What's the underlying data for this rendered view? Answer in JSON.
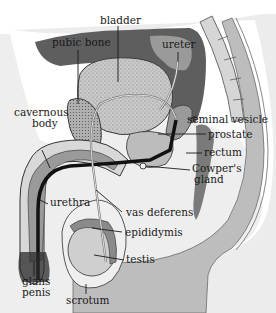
{
  "diagram": {
    "colors": {
      "background": "#ffffff",
      "body_fill": "#e4e4e4",
      "body_dark": "#5a5a5a",
      "bone_mid": "#8a8a8a",
      "organ_stipple": "#b8b8b8",
      "duct": "#111111",
      "outline": "#3a3a3a",
      "label_text": "#1a1a1a"
    },
    "labels": {
      "bladder": "bladder",
      "pubic_bone": "pubic bone",
      "ureter": "ureter",
      "cavernous_body_1": "cavernous",
      "cavernous_body_2": "body",
      "seminal_vesicle": "seminal vesicle",
      "prostate": "prostate",
      "rectum": "rectum",
      "cowpers_gland_1": "Cowper's",
      "cowpers_gland_2": "gland",
      "urethra": "urethra",
      "vas_deferens": "vas deferens",
      "epididymis": "epididymis",
      "testis": "testis",
      "glans_penis_1": "glans",
      "glans_penis_2": "penis",
      "scrotum": "scrotum"
    }
  }
}
